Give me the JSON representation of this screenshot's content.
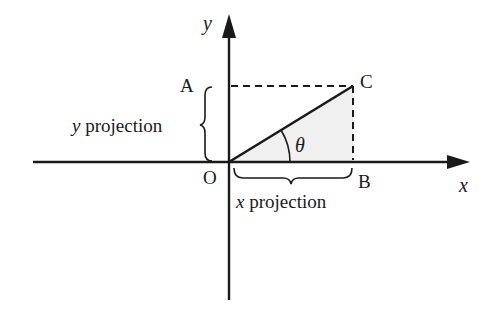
{
  "diagram": {
    "axes": {
      "x_label": "x",
      "y_label": "y"
    },
    "points": {
      "origin": "O",
      "a": "A",
      "b": "B",
      "c": "C"
    },
    "angle_label": "θ",
    "projections": {
      "x": {
        "var": "x",
        "text": "projection"
      },
      "y": {
        "var": "y",
        "text": "projection"
      }
    },
    "colors": {
      "line": "#1a1a1a",
      "shade": "#f0f0f0",
      "background": "#ffffff"
    }
  }
}
